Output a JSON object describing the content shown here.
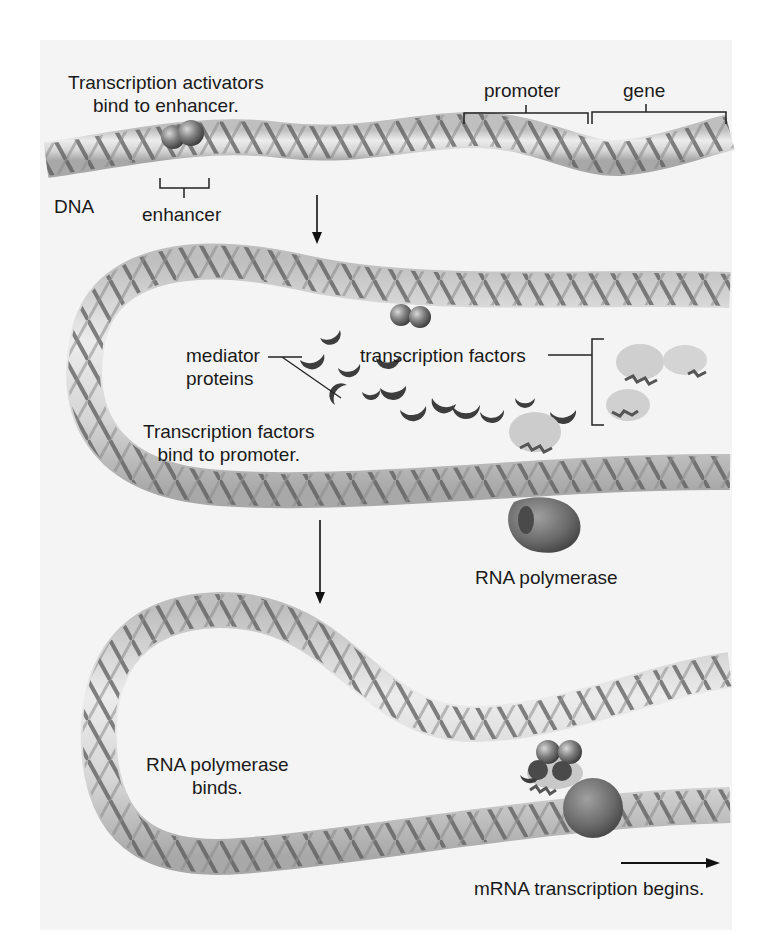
{
  "figure": {
    "colors": {
      "background": "#ffffff",
      "paper": "#f4f4f4",
      "dna_tube": "#d9d9d9",
      "dna_helix": "#5a5a5a",
      "activator": "#7a7a7a",
      "mediator": "#3d3d3d",
      "transcription_factor": "#c9c9c9",
      "rna_polymerase": "#6a6a6a",
      "text": "#1a1a1a"
    },
    "panels": [
      {
        "id": "step-1",
        "labels": {
          "caption": [
            "Transcription activators",
            "bind to enhancer."
          ],
          "dna": "DNA",
          "enhancer": "enhancer",
          "promoter": "promoter",
          "gene": "gene"
        }
      },
      {
        "id": "step-2",
        "labels": {
          "mediator": [
            "mediator",
            "proteins"
          ],
          "transcription_factors": "transcription factors",
          "caption": [
            "Transcription factors",
            "bind to promoter."
          ],
          "rna_polymerase": "RNA polymerase"
        }
      },
      {
        "id": "step-3",
        "labels": {
          "caption": [
            "RNA polymerase",
            "binds."
          ],
          "result": "mRNA transcription begins."
        }
      }
    ]
  }
}
